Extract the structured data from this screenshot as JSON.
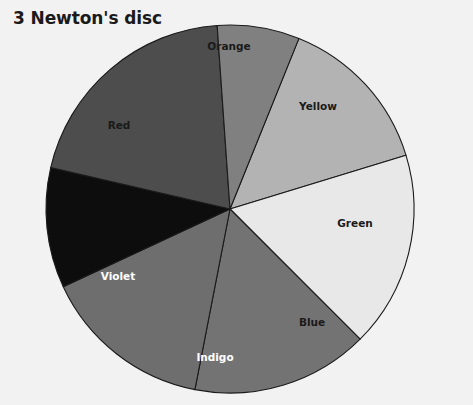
{
  "figure": {
    "title": "3 Newton's disc",
    "background_color": "#f2f2f2",
    "title_color": "#1a1a1a",
    "outline_color": "#1a1a1a"
  },
  "chart_data": {
    "type": "pie",
    "title": "3 Newton's disc",
    "xlabel": "",
    "ylabel": "",
    "grid": false,
    "legend": "none",
    "labels_position": "inside-slices",
    "center_px": [
      230,
      209
    ],
    "radius_px": 184,
    "start_angle_deg": -68,
    "direction": "clockwise",
    "categories": [
      "Orange",
      "Yellow",
      "Green",
      "Blue",
      "Indigo",
      "Violet",
      "Red"
    ],
    "values": [
      51,
      62,
      56,
      54,
      38,
      73,
      26
    ],
    "units": "degrees",
    "slices": [
      {
        "label": "Orange",
        "value": 51,
        "start_deg": -68,
        "end_deg": -17,
        "fill": "#b3b3b3",
        "label_color": "#1a1a1a",
        "label_x": 229,
        "label_y": 47
      },
      {
        "label": "Yellow",
        "value": 62,
        "start_deg": -17,
        "end_deg": 45,
        "fill": "#e8e8e8",
        "label_color": "#1a1a1a",
        "label_x": 318,
        "label_y": 107
      },
      {
        "label": "Green",
        "value": 56,
        "start_deg": 45,
        "end_deg": 101,
        "fill": "#737373",
        "label_color": "#1a1a1a",
        "label_x": 355,
        "label_y": 224
      },
      {
        "label": "Blue",
        "value": 54,
        "start_deg": 101,
        "end_deg": 155,
        "fill": "#6e6e6e",
        "label_color": "#1a1a1a",
        "label_x": 312,
        "label_y": 323
      },
      {
        "label": "Indigo",
        "value": 38,
        "start_deg": 155,
        "end_deg": 193,
        "fill": "#0d0d0d",
        "label_color": "#ffffff",
        "label_x": 215,
        "label_y": 358
      },
      {
        "label": "Violet",
        "value": 73,
        "start_deg": 193,
        "end_deg": 266,
        "fill": "#4d4d4d",
        "label_color": "#ffffff",
        "label_x": 118,
        "label_y": 277
      },
      {
        "label": "Red",
        "value": 26,
        "start_deg": 266,
        "end_deg": 292,
        "fill": "#808080",
        "label_color": "#1a1a1a",
        "label_x": 119,
        "label_y": 126
      }
    ]
  }
}
